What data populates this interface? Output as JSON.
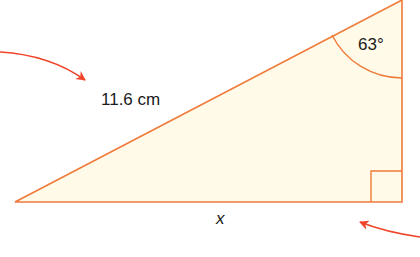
{
  "diagram": {
    "type": "right-triangle",
    "hypotenuse_label": "11.6 cm",
    "angle_label": "63°",
    "base_label": "x",
    "colors": {
      "stroke": "#f07a3a",
      "fill": "#fffbe8",
      "arrow": "#f0442a",
      "text": "#1a1a1a"
    }
  }
}
